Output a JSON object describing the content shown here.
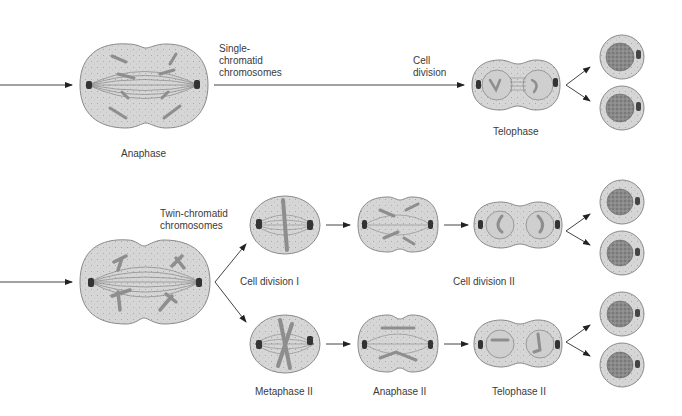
{
  "colors": {
    "cell_fill": "#d8d8d8",
    "cell_stroke": "#8a8a8a",
    "chromosome": "#8e8e8e",
    "centriole": "#3a3a3a",
    "nucleus": "#9a9a9a",
    "arrow": "#333333",
    "text": "#3a3a3a"
  },
  "top_row": {
    "stage_label": "Anaphase",
    "arrow_label": "Single-\nchromatid\nchromosomes",
    "division_label": "Cell\ndivision",
    "telophase_label": "Telophase"
  },
  "bottom_row": {
    "arrow_label": "Twin-chromatid\nchromosomes",
    "division_one_label": "Cell division I",
    "division_two_label": "Cell division II",
    "metaphase_label": "Metaphase II",
    "anaphase_label": "Anaphase II",
    "telophase_label": "Telophase II"
  }
}
